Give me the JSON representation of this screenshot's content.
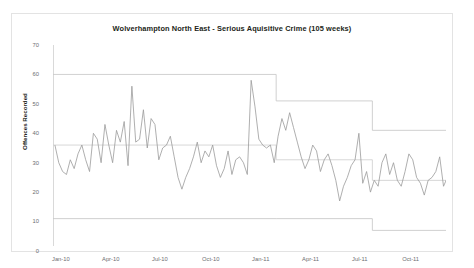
{
  "chart_data": {
    "type": "line",
    "title": "Wolverhampton North East  - Serious Aquisitive Crime (105 weeks)",
    "xlabel": "",
    "ylabel": "Offences Recorded",
    "ylim": [
      0,
      70
    ],
    "yticks": [
      0,
      10,
      20,
      30,
      40,
      50,
      60,
      70
    ],
    "grid": false,
    "legend": "none",
    "xticklabels": [
      "Jan-10",
      "Apr-10",
      "Jul-10",
      "Oct-10",
      "Jan-11",
      "Apr-11",
      "Jul-11",
      "Oct-11"
    ],
    "xtick_weeks": [
      0,
      13,
      26,
      39,
      52,
      65,
      78,
      91
    ],
    "x_count": 105,
    "series": [
      {
        "name": "Offences Recorded",
        "color": "#9a9a9a",
        "values": [
          36,
          30,
          27,
          26,
          31,
          28,
          33,
          36,
          31,
          27,
          40,
          38,
          30,
          43,
          36,
          30,
          41,
          37,
          44,
          29,
          56,
          37,
          38,
          48,
          35,
          45,
          43,
          31,
          35,
          36,
          39,
          32,
          25,
          21,
          25,
          28,
          32,
          37,
          30,
          34,
          32,
          36,
          29,
          25,
          28,
          34,
          26,
          31,
          32,
          30,
          26,
          58,
          49,
          38,
          36,
          35,
          36,
          30,
          39,
          45,
          41,
          47,
          42,
          37,
          32,
          28,
          31,
          36,
          34,
          27,
          31,
          33,
          29,
          24,
          17,
          22,
          25,
          29,
          31,
          40,
          23,
          27,
          20,
          24,
          22,
          30,
          33,
          26,
          30,
          24,
          22,
          27,
          33,
          31,
          25,
          23,
          19,
          24,
          25,
          27,
          32,
          22,
          25,
          27,
          33
        ]
      },
      {
        "name": "Upper control limit",
        "color": "#c8c8c8",
        "step_points": [
          [
            0,
            60
          ],
          [
            58,
            60
          ],
          [
            58,
            51
          ],
          [
            83,
            51
          ],
          [
            83,
            41
          ],
          [
            105,
            41
          ]
        ]
      },
      {
        "name": "Mean",
        "color": "#d0d0d0",
        "step_points": [
          [
            0,
            36
          ],
          [
            58,
            36
          ],
          [
            58,
            31
          ],
          [
            83,
            31
          ],
          [
            83,
            24
          ],
          [
            105,
            24
          ]
        ]
      },
      {
        "name": "Lower control limit",
        "color": "#c8c8c8",
        "step_points": [
          [
            0,
            11
          ],
          [
            58,
            11
          ],
          [
            58,
            11
          ],
          [
            83,
            11
          ],
          [
            83,
            7
          ],
          [
            105,
            7
          ]
        ]
      }
    ]
  }
}
